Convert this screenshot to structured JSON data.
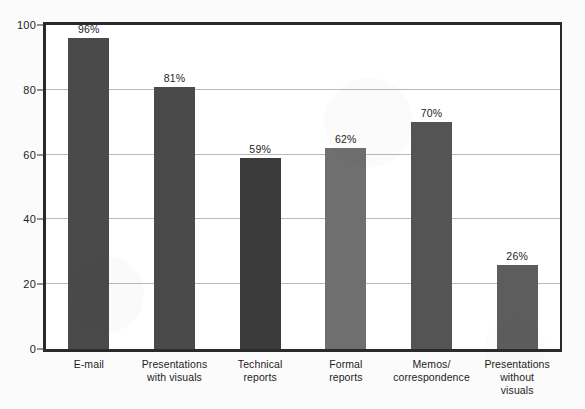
{
  "chart_data": {
    "type": "bar",
    "title": "",
    "subtitle": "",
    "xlabel": "",
    "ylabel": "",
    "ylim": [
      0,
      100
    ],
    "yticks": [
      0,
      20,
      40,
      60,
      80,
      100
    ],
    "ytick_labels": [
      "0",
      "20",
      "40",
      "60",
      "80",
      "100"
    ],
    "grid": true,
    "legend": false,
    "legend_position": "none",
    "categories": [
      "E-mail",
      "Presentations with visuals",
      "Technical reports",
      "Formal reports",
      "Memos/correspondence",
      "Presentations without visuals"
    ],
    "category_lines": [
      [
        "E-mail"
      ],
      [
        "Presentations",
        "with visuals"
      ],
      [
        "Technical",
        "reports"
      ],
      [
        "Formal",
        "reports"
      ],
      [
        "Memos/",
        "correspondence"
      ],
      [
        "Presentations",
        "without",
        "visuals"
      ]
    ],
    "values": [
      96,
      81,
      59,
      62,
      70,
      26
    ],
    "value_labels": [
      "96%",
      "81%",
      "59%",
      "62%",
      "70%",
      "26%"
    ],
    "bar_colors": [
      "#4a4a4a",
      "#4a4a4a",
      "#3b3b3b",
      "#6f6f6f",
      "#545454",
      "#5d5d5d"
    ],
    "axis_color": "#2a2a2a",
    "grid_color": "#b9b9b9",
    "background_color": "#ffffff",
    "page_color": "#fbfbfb",
    "text_color": "#1d1d1d"
  }
}
